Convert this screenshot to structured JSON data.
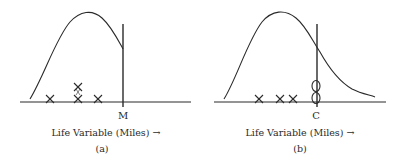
{
  "panels": [
    {
      "id": "a",
      "caption": "(a)",
      "axis_label": "Life Variable (Miles) →",
      "cut_label": "M",
      "curve": "truncated right-skewed distribution ending at vertical line M",
      "markers": [
        {
          "type": "failure-x",
          "count": 1
        },
        {
          "type": "failure-x",
          "count": 2
        },
        {
          "type": "failure-x",
          "count": 1
        }
      ]
    },
    {
      "id": "b",
      "caption": "(b)",
      "axis_label": "Life Variable (Miles) →",
      "cut_label": "C",
      "curve": "full right-skewed distribution crossing vertical line C",
      "markers": [
        {
          "type": "failure-x",
          "count": 1
        },
        {
          "type": "failure-x",
          "count": 1
        },
        {
          "type": "failure-x",
          "count": 1
        },
        {
          "type": "censored-o",
          "count": 2
        }
      ]
    }
  ],
  "colors": {
    "stroke": "#2a2a2a",
    "background": "#ffffff"
  }
}
